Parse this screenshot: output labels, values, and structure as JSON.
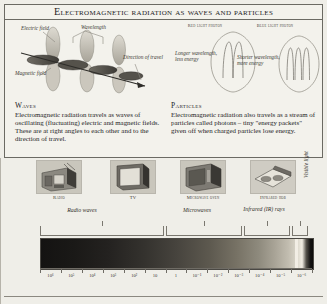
{
  "panel": {
    "title": "Electromagnetic radiation as waves and particles"
  },
  "wave_diagram": {
    "labels": {
      "electric_field": "Electric field",
      "magnetic_field": "Magnetic field",
      "wavelength": "Wavelength",
      "direction": "Direction of travel"
    }
  },
  "photon_diagram": {
    "red_photon_caption": "Red light photon",
    "blue_photon_caption": "Blue light photon",
    "red_note": "Longer wavelength, less energy",
    "blue_note": "Shorter wavelength, more energy"
  },
  "columns": {
    "waves": {
      "heading": "Waves",
      "body": "Electromagnetic radiation travels as waves of oscillating (fluctuating) electric and magnetic fields. These are at right angles to each other and to the direction of travel."
    },
    "particles": {
      "heading": "Particles",
      "body": "Electromagnetic radiation also travels as a stream of particles called photons – tiny \"energy packets\" given off when charged particles lose energy."
    }
  },
  "devices": [
    {
      "name": "radio",
      "label": "Radio"
    },
    {
      "name": "tv",
      "label": "TV"
    },
    {
      "name": "microwave-oven",
      "label": "Microwave oven"
    },
    {
      "name": "infrared-hob",
      "label": "Infrared hob"
    }
  ],
  "bands": [
    {
      "name": "radio-waves",
      "label": "Radio waves"
    },
    {
      "name": "microwaves",
      "label": "Microwaves"
    },
    {
      "name": "infrared",
      "label": "Infrared (IR) rays"
    },
    {
      "name": "visible-light",
      "label": "Visible light"
    }
  ],
  "chart_data": {
    "type": "heatmap",
    "xlabel": "Wavelength (metres)",
    "ylabel": "",
    "grid": false,
    "legend_position": "above",
    "tick_labels": [
      "10⁶",
      "10⁵",
      "10⁴",
      "10³",
      "10²",
      "10",
      "1",
      "10⁻¹",
      "10⁻²",
      "10⁻³",
      "10⁻⁴",
      "10⁻⁵",
      "10⁻⁶"
    ],
    "x": [
      6,
      5,
      4,
      3,
      2,
      1,
      0,
      -1,
      -2,
      -3,
      -4,
      -5,
      -6
    ],
    "categories": [
      "Radio waves",
      "Microwaves",
      "Infrared (IR) rays",
      "Visible light"
    ],
    "series": [
      {
        "name": "band-extent-log10-metres",
        "values": [
          {
            "band": "Radio waves",
            "from": 6,
            "to": 0
          },
          {
            "band": "Microwaves",
            "from": 0,
            "to": -3
          },
          {
            "band": "Infrared (IR) rays",
            "from": -3,
            "to": -6
          },
          {
            "band": "Visible light",
            "from": -6,
            "to": -6
          }
        ]
      }
    ],
    "annotations": [
      "Radio — Radio waves",
      "TV — Radio waves",
      "Microwave oven — Microwaves",
      "Infrared hob — Infrared (IR) rays"
    ]
  },
  "colors": {
    "paper": "#efeee8",
    "panel": "#f3f2ec",
    "rule": "#6b6a63",
    "ink": "#24231f",
    "spectrum_dark": "#141312",
    "spectrum_light": "#f0ece2"
  }
}
